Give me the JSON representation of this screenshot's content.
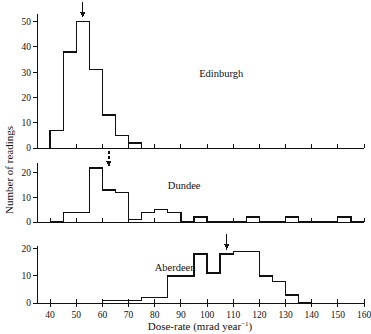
{
  "figure": {
    "xlabel_main": "Dose-rate (mrad year",
    "xlabel_sup": "−1",
    "xlabel_tail": ")",
    "ylabel": "Number of readings"
  },
  "chart_data": {
    "type": "bar",
    "title": "",
    "xlabel": "Dose-rate (mrad year−1)",
    "ylabel": "Number of readings",
    "xlim": [
      35,
      160
    ],
    "bin_width": 5,
    "xticks": [
      40,
      50,
      60,
      70,
      80,
      90,
      100,
      110,
      120,
      130,
      140,
      150,
      160
    ],
    "xtick_labels": [
      "40",
      "50",
      "60",
      "70",
      "80",
      "90",
      "100",
      "110",
      "120",
      "130",
      "140",
      "150",
      "160"
    ],
    "panels": [
      {
        "name": "Edinburgh",
        "label": "Edinburgh",
        "label_x": 97,
        "ylim": [
          0,
          53
        ],
        "yticks": [
          0,
          10,
          20,
          30,
          40,
          50
        ],
        "ytick_labels": [
          "0",
          "10",
          "20",
          "30",
          "40",
          "50"
        ],
        "arrow": {
          "x": 52.5,
          "style": "solid"
        },
        "bins": [
          {
            "x0": 40,
            "x1": 45,
            "count": 7
          },
          {
            "x0": 45,
            "x1": 50,
            "count": 38
          },
          {
            "x0": 50,
            "x1": 55,
            "count": 50
          },
          {
            "x0": 55,
            "x1": 60,
            "count": 31
          },
          {
            "x0": 60,
            "x1": 65,
            "count": 13
          },
          {
            "x0": 65,
            "x1": 70,
            "count": 5
          },
          {
            "x0": 70,
            "x1": 75,
            "count": 2
          }
        ]
      },
      {
        "name": "Dundee",
        "label": "Dundee",
        "label_x": 85,
        "ylim": [
          0,
          24
        ],
        "yticks": [
          0,
          10,
          20
        ],
        "ytick_labels": [
          "0",
          "10",
          "20"
        ],
        "arrow": {
          "x": 62.5,
          "style": "dashed"
        },
        "bins": [
          {
            "x0": 40,
            "x1": 45,
            "count": 0
          },
          {
            "x0": 45,
            "x1": 50,
            "count": 4
          },
          {
            "x0": 50,
            "x1": 55,
            "count": 4
          },
          {
            "x0": 55,
            "x1": 60,
            "count": 22
          },
          {
            "x0": 60,
            "x1": 65,
            "count": 13
          },
          {
            "x0": 65,
            "x1": 70,
            "count": 12
          },
          {
            "x0": 70,
            "x1": 75,
            "count": 1
          },
          {
            "x0": 75,
            "x1": 80,
            "count": 4
          },
          {
            "x0": 80,
            "x1": 85,
            "count": 5
          },
          {
            "x0": 85,
            "x1": 90,
            "count": 4
          },
          {
            "x0": 90,
            "x1": 95,
            "count": 0
          },
          {
            "x0": 95,
            "x1": 100,
            "count": 2
          },
          {
            "x0": 100,
            "x1": 105,
            "count": 0
          },
          {
            "x0": 105,
            "x1": 110,
            "count": 0
          },
          {
            "x0": 110,
            "x1": 115,
            "count": 0
          },
          {
            "x0": 115,
            "x1": 120,
            "count": 2
          },
          {
            "x0": 120,
            "x1": 125,
            "count": 0
          },
          {
            "x0": 125,
            "x1": 130,
            "count": 0
          },
          {
            "x0": 130,
            "x1": 135,
            "count": 2
          },
          {
            "x0": 135,
            "x1": 140,
            "count": 0
          },
          {
            "x0": 140,
            "x1": 145,
            "count": 0
          },
          {
            "x0": 145,
            "x1": 150,
            "count": 0
          },
          {
            "x0": 150,
            "x1": 155,
            "count": 2
          },
          {
            "x0": 155,
            "x1": 160,
            "count": 0
          }
        ]
      },
      {
        "name": "Aberdeen",
        "label": "Aberdeen",
        "label_x": 80,
        "ylim": [
          0,
          21
        ],
        "yticks": [
          0,
          10,
          20
        ],
        "ytick_labels": [
          "0",
          "10",
          "20"
        ],
        "arrow": {
          "x": 107.5,
          "style": "solid"
        },
        "bins": [
          {
            "x0": 60,
            "x1": 65,
            "count": 1
          },
          {
            "x0": 65,
            "x1": 70,
            "count": 1
          },
          {
            "x0": 70,
            "x1": 75,
            "count": 1
          },
          {
            "x0": 75,
            "x1": 80,
            "count": 2
          },
          {
            "x0": 80,
            "x1": 85,
            "count": 2
          },
          {
            "x0": 85,
            "x1": 90,
            "count": 10
          },
          {
            "x0": 90,
            "x1": 95,
            "count": 10
          },
          {
            "x0": 95,
            "x1": 100,
            "count": 18
          },
          {
            "x0": 100,
            "x1": 105,
            "count": 11
          },
          {
            "x0": 105,
            "x1": 110,
            "count": 18
          },
          {
            "x0": 110,
            "x1": 115,
            "count": 19
          },
          {
            "x0": 115,
            "x1": 120,
            "count": 19
          },
          {
            "x0": 120,
            "x1": 125,
            "count": 10
          },
          {
            "x0": 125,
            "x1": 130,
            "count": 8
          },
          {
            "x0": 130,
            "x1": 135,
            "count": 3
          },
          {
            "x0": 135,
            "x1": 140,
            "count": 0
          }
        ]
      }
    ]
  }
}
